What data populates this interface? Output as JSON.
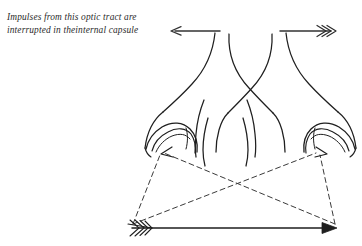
{
  "figure": {
    "background_color": "#ffffff",
    "ink_color": "#1f1f1f",
    "annotation": {
      "line1": "Impulses from this optic tract are",
      "line2": "interrupted in theinternal capsule",
      "full_text": "Impulses from this optic tract are\ninterrupted in theinternal capsule",
      "style": "italic-handwritten",
      "color": "#2b2b2b"
    },
    "labels": {
      "left_tract_arrow": "",
      "right_tract_arrow": "",
      "object_arrow": ""
    },
    "elements": [
      {
        "name": "left-optic-tract-arrow",
        "kind": "arrow",
        "direction": "left",
        "head_style": "single",
        "x1": 220,
        "y1": 31,
        "x2": 172,
        "y2": 31
      },
      {
        "name": "right-optic-tract-arrow",
        "kind": "arrow",
        "direction": "right",
        "head_style": "triple-chevron",
        "x1": 281,
        "y1": 31,
        "x2": 332,
        "y2": 31
      },
      {
        "name": "object-arrow",
        "kind": "arrow",
        "direction": "right",
        "head_style": "solid-head-fletched-tail",
        "x1": 131,
        "y1": 228,
        "x2": 337,
        "y2": 228
      },
      {
        "name": "optic-chiasm",
        "kind": "crossing-fiber-bundle"
      },
      {
        "name": "left-retina",
        "kind": "eye-cup"
      },
      {
        "name": "right-retina",
        "kind": "eye-cup"
      },
      {
        "name": "sight-line-left-tail-to-right-retina",
        "kind": "dashed-ray",
        "x1": 131,
        "y1": 225,
        "x2": 318,
        "y2": 152
      },
      {
        "name": "sight-line-right-head-to-left-retina",
        "kind": "dashed-ray",
        "x1": 336,
        "y1": 225,
        "x2": 162,
        "y2": 152
      },
      {
        "name": "sight-line-left-tail-to-left-retina",
        "kind": "dashed-ray",
        "x1": 131,
        "y1": 225,
        "x2": 160,
        "y2": 154
      },
      {
        "name": "sight-line-right-head-to-right-retina",
        "kind": "dashed-ray",
        "x1": 336,
        "y1": 225,
        "x2": 320,
        "y2": 154
      }
    ]
  }
}
